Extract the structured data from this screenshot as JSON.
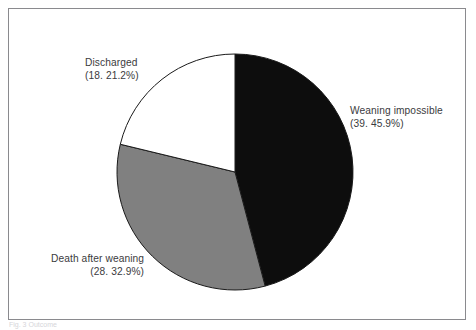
{
  "figure": {
    "frame_border_color": "#8a8a8e",
    "background_color": "#ffffff",
    "caption_fragment": "Fig. 3 Outcome"
  },
  "labels": {
    "discharged": {
      "name": "Discharged",
      "value": "(18. 21.2%)"
    },
    "weaning_impossible": {
      "name": "Weaning impossible",
      "value": "(39. 45.9%)"
    },
    "death_after_weaning": {
      "name": "Death after weaning",
      "value": "(28. 32.9%)"
    }
  },
  "chart_data": {
    "type": "pie",
    "title": "",
    "subtitle": "",
    "xlabel": "",
    "ylabel": "",
    "legend_position": "none",
    "grid": false,
    "total_count": 85,
    "start_angle_deg": 0,
    "direction": "clockwise",
    "center_px": [
      226,
      163
    ],
    "radius_px": 118,
    "categories": [
      "Weaning impossible",
      "Death after weaning",
      "Discharged"
    ],
    "values": [
      39,
      28,
      18
    ],
    "percentages": [
      45.9,
      32.9,
      21.2
    ],
    "slice_colors": [
      "#0d0d0d",
      "#808080",
      "#ffffff"
    ],
    "slice_edge_color": "#1a1a1a",
    "annotations": [
      "Weaning impossible (39. 45.9%)",
      "Death after weaning (28. 32.9%)",
      "Discharged (18. 21.2%)"
    ],
    "slices": [
      {
        "label": "Weaning impossible",
        "count": 39,
        "percent": 45.9,
        "color": "#0d0d0d",
        "start_deg": 0.0,
        "end_deg": 165.2
      },
      {
        "label": "Death after weaning",
        "count": 28,
        "percent": 32.9,
        "color": "#808080",
        "start_deg": 165.2,
        "end_deg": 283.6
      },
      {
        "label": "Discharged",
        "count": 18,
        "percent": 21.2,
        "color": "#ffffff",
        "start_deg": 283.6,
        "end_deg": 360.0
      }
    ]
  }
}
